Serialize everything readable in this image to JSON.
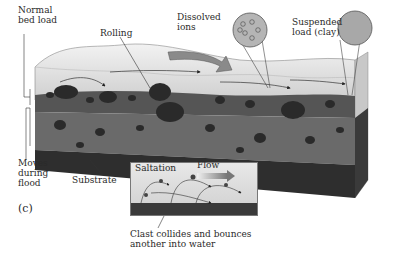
{
  "figure": {
    "panel_label": "(c)",
    "labels": {
      "normal_bed_load": "Normal bed load",
      "rolling": "Rolling",
      "dissolved_ions": "Dissolved ions",
      "suspended_load": "Suspended load (clay)",
      "moves_during_flood": "Moves during flood",
      "substrate": "Substrate",
      "saltation": "Saltation",
      "flow": "Flow",
      "clast_collides": "Clast collides and bounces another into water"
    },
    "colors": {
      "water": "#dcdcdc",
      "water_surface": "#eeeeee",
      "bed_load": "#555555",
      "flood_layer": "#6a6a6a",
      "substrate": "#2e2e2e",
      "clast": "#2a2a2a",
      "inset_bg": "#d8d8d8"
    }
  }
}
